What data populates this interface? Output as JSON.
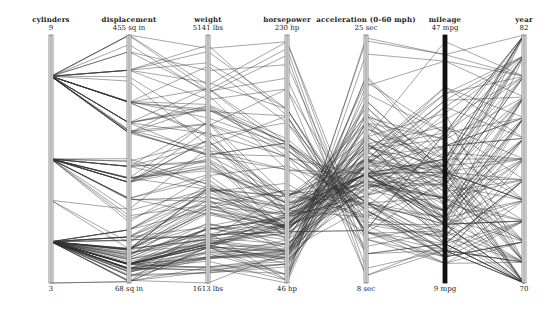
{
  "chart_data": {
    "type": "parallel_coordinates",
    "title": "",
    "axes": [
      {
        "name": "cylinders",
        "label": "cylinders",
        "max_label": "9",
        "min_label": "3",
        "min": 3,
        "max": 9
      },
      {
        "name": "displacement",
        "label": "displacement",
        "max_label": "455 sq in",
        "min_label": "68 sq in",
        "min": 68,
        "max": 455
      },
      {
        "name": "weight",
        "label": "weight",
        "max_label": "5141 lbs",
        "min_label": "1613 lbs",
        "min": 1613,
        "max": 5141
      },
      {
        "name": "horsepower",
        "label": "horsepower",
        "max_label": "230 hp",
        "min_label": "46 hp",
        "min": 46,
        "max": 230
      },
      {
        "name": "acceleration",
        "label": "acceleration (0-60 mph)",
        "max_label": "25 sec",
        "min_label": "8 sec",
        "min": 8,
        "max": 25
      },
      {
        "name": "mileage",
        "label": "mileage",
        "max_label": "47 mpg",
        "min_label": "9 mpg",
        "min": 9,
        "max": 47
      },
      {
        "name": "year",
        "label": "year",
        "max_label": "82",
        "min_label": "70",
        "min": 70,
        "max": 82
      }
    ],
    "records": [
      [
        8,
        307,
        3504,
        130,
        12.0,
        18,
        70
      ],
      [
        8,
        350,
        3693,
        165,
        11.5,
        15,
        70
      ],
      [
        8,
        318,
        3436,
        150,
        11.0,
        18,
        70
      ],
      [
        8,
        304,
        3433,
        150,
        12.0,
        16,
        70
      ],
      [
        8,
        302,
        3449,
        140,
        10.5,
        17,
        70
      ],
      [
        8,
        429,
        4341,
        198,
        10.0,
        15,
        70
      ],
      [
        8,
        454,
        4354,
        220,
        9.0,
        14,
        70
      ],
      [
        8,
        440,
        4312,
        215,
        8.5,
        14,
        70
      ],
      [
        8,
        455,
        4425,
        225,
        10.0,
        14,
        70
      ],
      [
        8,
        390,
        3850,
        190,
        8.5,
        15,
        70
      ],
      [
        4,
        113,
        2372,
        95,
        15.0,
        24,
        70
      ],
      [
        6,
        198,
        2833,
        95,
        15.5,
        22,
        70
      ],
      [
        6,
        199,
        2774,
        97,
        15.5,
        18,
        70
      ],
      [
        6,
        200,
        2587,
        85,
        16.0,
        21,
        70
      ],
      [
        4,
        97,
        2130,
        88,
        14.5,
        27,
        70
      ],
      [
        4,
        97,
        1835,
        46,
        20.5,
        26,
        70
      ],
      [
        4,
        110,
        2672,
        87,
        17.5,
        25,
        70
      ],
      [
        4,
        104,
        2375,
        95,
        17.5,
        24,
        70
      ],
      [
        4,
        121,
        2234,
        113,
        12.5,
        26,
        70
      ],
      [
        8,
        383,
        3563,
        170,
        10.0,
        15,
        70
      ],
      [
        4,
        140,
        2264,
        90,
        15.5,
        28,
        71
      ],
      [
        4,
        98,
        2164,
        95,
        14.0,
        25,
        71
      ],
      [
        6,
        232,
        3288,
        100,
        15.5,
        19,
        71
      ],
      [
        6,
        225,
        3264,
        105,
        16.0,
        16,
        71
      ],
      [
        6,
        250,
        3329,
        100,
        15.5,
        17,
        71
      ],
      [
        8,
        400,
        4464,
        175,
        11.5,
        14,
        71
      ],
      [
        8,
        351,
        4154,
        153,
        13.5,
        14,
        71
      ],
      [
        8,
        318,
        4096,
        150,
        13.0,
        14,
        71
      ],
      [
        4,
        71,
        1773,
        65,
        19.0,
        31,
        71
      ],
      [
        4,
        72,
        1613,
        69,
        18.0,
        35,
        71
      ],
      [
        4,
        97,
        1834,
        60,
        19.0,
        27,
        71
      ],
      [
        4,
        91,
        1955,
        70,
        20.5,
        26,
        71
      ],
      [
        8,
        400,
        4746,
        175,
        12.0,
        12,
        71
      ],
      [
        6,
        258,
        2962,
        110,
        13.5,
        18,
        71
      ],
      [
        4,
        97,
        2288,
        88,
        17.0,
        24,
        72
      ],
      [
        4,
        140,
        2408,
        72,
        19.0,
        22,
        72
      ],
      [
        4,
        122,
        2226,
        86,
        16.5,
        22,
        72
      ],
      [
        8,
        350,
        4699,
        165,
        13.0,
        13,
        72
      ],
      [
        8,
        400,
        4906,
        175,
        11.5,
        12,
        72
      ],
      [
        8,
        318,
        4135,
        150,
        13.5,
        13,
        72
      ],
      [
        8,
        429,
        4633,
        208,
        11.0,
        13,
        72
      ],
      [
        4,
        70,
        2124,
        97,
        13.5,
        19,
        72
      ],
      [
        4,
        79,
        2074,
        67,
        19.5,
        26,
        72
      ],
      [
        4,
        116,
        2158,
        90,
        15.5,
        28,
        72
      ],
      [
        3,
        70,
        2124,
        90,
        13.5,
        18,
        73
      ],
      [
        8,
        350,
        4082,
        145,
        13.0,
        14,
        73
      ],
      [
        8,
        318,
        4077,
        150,
        14.0,
        15,
        73
      ],
      [
        6,
        250,
        3021,
        100,
        16.5,
        18,
        73
      ],
      [
        6,
        232,
        2945,
        100,
        15.5,
        18,
        73
      ],
      [
        4,
        98,
        2164,
        83,
        15.0,
        22,
        73
      ],
      [
        4,
        120,
        2979,
        97,
        19.5,
        21,
        73
      ],
      [
        8,
        455,
        4951,
        225,
        11.0,
        12,
        73
      ],
      [
        8,
        400,
        4997,
        170,
        11.5,
        13,
        73
      ],
      [
        4,
        96,
        2189,
        69,
        18.0,
        26,
        73
      ],
      [
        4,
        90,
        2108,
        75,
        15.5,
        24,
        74
      ],
      [
        4,
        79,
        1963,
        67,
        15.5,
        26,
        74
      ],
      [
        4,
        122,
        2451,
        80,
        16.5,
        26,
        74
      ],
      [
        6,
        258,
        3632,
        110,
        18.0,
        16,
        74
      ],
      [
        6,
        225,
        3645,
        95,
        16.0,
        18,
        74
      ],
      [
        8,
        302,
        4129,
        140,
        13.0,
        13,
        74
      ],
      [
        4,
        108,
        2391,
        93,
        15.5,
        26,
        74
      ],
      [
        4,
        71,
        1836,
        65,
        21.0,
        32,
        74
      ],
      [
        4,
        97,
        2164,
        88,
        14.0,
        29,
        74
      ],
      [
        6,
        250,
        3897,
        100,
        15.0,
        19,
        74
      ],
      [
        4,
        121,
        2671,
        115,
        13.5,
        22,
        75
      ],
      [
        6,
        225,
        3785,
        95,
        19.0,
        18,
        75
      ],
      [
        6,
        250,
        3571,
        110,
        16.5,
        15,
        75
      ],
      [
        8,
        351,
        3962,
        148,
        13.5,
        15,
        75
      ],
      [
        4,
        115,
        2246,
        95,
        14.0,
        26,
        75
      ],
      [
        4,
        90,
        2223,
        71,
        16.5,
        25,
        75
      ],
      [
        4,
        120,
        2957,
        81,
        17.0,
        23,
        75
      ],
      [
        8,
        318,
        4385,
        150,
        13.5,
        14,
        75
      ],
      [
        6,
        231,
        3907,
        110,
        16.0,
        15,
        75
      ],
      [
        4,
        97,
        2254,
        75,
        14.5,
        33,
        75
      ],
      [
        4,
        85,
        2035,
        52,
        22.2,
        29,
        76
      ],
      [
        4,
        98,
        2164,
        60,
        22.1,
        28,
        76
      ],
      [
        6,
        250,
        3353,
        105,
        14.5,
        20,
        76
      ],
      [
        8,
        302,
        4294,
        130,
        14.9,
        16,
        76
      ],
      [
        4,
        140,
        2720,
        88,
        14.8,
        22,
        76
      ],
      [
        4,
        101,
        2202,
        83,
        15.3,
        27,
        76
      ],
      [
        6,
        225,
        3651,
        100,
        17.7,
        19,
        76
      ],
      [
        8,
        350,
        4380,
        145,
        12.8,
        13,
        76
      ],
      [
        4,
        91,
        1795,
        53,
        17.5,
        33,
        76
      ],
      [
        4,
        97,
        2391,
        78,
        14.5,
        26,
        76
      ],
      [
        4,
        97,
        1965,
        75,
        14.4,
        30,
        77
      ],
      [
        4,
        89,
        1845,
        62,
        15.3,
        36,
        77
      ],
      [
        8,
        305,
        3880,
        145,
        12.5,
        17,
        77
      ],
      [
        6,
        200,
        3085,
        85,
        16.6,
        19,
        77
      ],
      [
        4,
        134,
        2702,
        97,
        15.0,
        22,
        77
      ],
      [
        8,
        400,
        4220,
        190,
        12.2,
        16,
        77
      ],
      [
        6,
        231,
        3245,
        105,
        15.4,
        20,
        77
      ],
      [
        4,
        79,
        1755,
        58,
        16.9,
        39,
        77
      ],
      [
        4,
        98,
        2135,
        68,
        16.6,
        30,
        77
      ],
      [
        5,
        121,
        2950,
        103,
        15.4,
        20,
        77
      ],
      [
        4,
        97,
        1985,
        78,
        16.0,
        30,
        78
      ],
      [
        4,
        105,
        2200,
        70,
        13.2,
        30,
        78
      ],
      [
        6,
        225,
        3430,
        110,
        17.2,
        20,
        78
      ],
      [
        8,
        318,
        3735,
        140,
        13.2,
        19,
        78
      ],
      [
        4,
        151,
        2855,
        88,
        17.6,
        23,
        78
      ],
      [
        4,
        89,
        2050,
        71,
        14.0,
        32,
        78
      ],
      [
        5,
        131,
        2830,
        103,
        15.9,
        20,
        78
      ],
      [
        6,
        163,
        3140,
        133,
        13.6,
        16,
        78
      ],
      [
        4,
        86,
        1985,
        65,
        16.4,
        39,
        78
      ],
      [
        8,
        302,
        3870,
        139,
        15.4,
        18,
        78
      ],
      [
        4,
        98,
        2120,
        70,
        17.2,
        31,
        79
      ],
      [
        4,
        119,
        2300,
        97,
        14.7,
        24,
        79
      ],
      [
        6,
        231,
        3380,
        105,
        14.9,
        20,
        79
      ],
      [
        8,
        350,
        4054,
        170,
        11.4,
        17,
        79
      ],
      [
        4,
        89,
        1925,
        48,
        21.5,
        43,
        79
      ],
      [
        4,
        151,
        2670,
        90,
        16.0,
        27,
        79
      ],
      [
        5,
        183,
        3530,
        77,
        20.1,
        25,
        79
      ],
      [
        8,
        305,
        3425,
        130,
        15.5,
        19,
        79
      ],
      [
        4,
        85,
        1970,
        70,
        16.2,
        37,
        79
      ],
      [
        6,
        200,
        3155,
        85,
        18.2,
        21,
        79
      ],
      [
        4,
        97,
        2130,
        48,
        24.8,
        44,
        80
      ],
      [
        4,
        90,
        2335,
        48,
        23.7,
        43,
        80
      ],
      [
        4,
        86,
        2110,
        65,
        17.9,
        46,
        80
      ],
      [
        4,
        121,
        2800,
        67,
        21.8,
        32,
        80
      ],
      [
        4,
        91,
        1800,
        60,
        16.4,
        38,
        80
      ],
      [
        4,
        140,
        2905,
        88,
        18.0,
        26,
        80
      ],
      [
        6,
        173,
        2725,
        115,
        12.6,
        28,
        80
      ],
      [
        4,
        151,
        3003,
        90,
        20.1,
        24,
        80
      ],
      [
        3,
        70,
        2420,
        100,
        12.5,
        24,
        80
      ],
      [
        4,
        98,
        2045,
        65,
        16.2,
        34,
        80
      ],
      [
        4,
        81,
        1760,
        60,
        16.1,
        36,
        81
      ],
      [
        4,
        105,
        2150,
        63,
        14.9,
        35,
        81
      ],
      [
        6,
        168,
        2910,
        120,
        11.4,
        25,
        81
      ],
      [
        4,
        107,
        2464,
        74,
        15.2,
        28,
        81
      ],
      [
        6,
        225,
        3360,
        85,
        16.6,
        18,
        81
      ],
      [
        4,
        112,
        2385,
        88,
        18.6,
        27,
        81
      ],
      [
        4,
        91,
        1985,
        68,
        16.0,
        37,
        81
      ],
      [
        6,
        262,
        3015,
        85,
        17.0,
        38,
        81
      ],
      [
        8,
        350,
        3725,
        105,
        19.0,
        26,
        81
      ],
      [
        4,
        120,
        2625,
        88,
        17.3,
        32,
        81
      ],
      [
        4,
        112,
        2605,
        88,
        19.6,
        28,
        82
      ],
      [
        4,
        135,
        2295,
        84,
        11.6,
        32,
        82
      ],
      [
        4,
        151,
        2950,
        90,
        17.3,
        27,
        82
      ],
      [
        4,
        140,
        2790,
        86,
        15.6,
        27,
        82
      ],
      [
        4,
        97,
        2130,
        52,
        24.6,
        44,
        82
      ],
      [
        4,
        135,
        2295,
        84,
        11.6,
        32,
        82
      ],
      [
        4,
        120,
        2625,
        79,
        18.6,
        28,
        82
      ],
      [
        4,
        119,
        2720,
        82,
        19.4,
        31,
        82
      ],
      [
        6,
        181,
        2945,
        110,
        16.4,
        25,
        82
      ],
      [
        6,
        232,
        3210,
        112,
        14.7,
        22,
        82
      ]
    ],
    "layout": {
      "axis_x": [
        51,
        129,
        208,
        287,
        366,
        445,
        524
      ],
      "top_y": 35,
      "bottom_y": 283,
      "line_color": "#333333",
      "axis_color": "#777777",
      "mileage_axis_color": "#111111",
      "legend": "none",
      "grid": false
    }
  }
}
